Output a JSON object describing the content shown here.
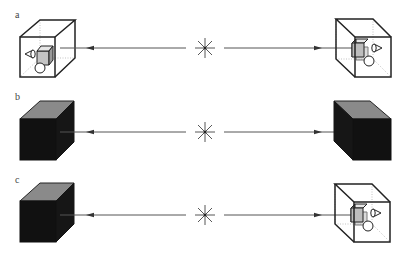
{
  "figure": {
    "colors": {
      "line": "#222222",
      "arrow_line": "#555555",
      "cube_dark": "#161616",
      "cube_top": "#8a8a8a",
      "inner_cube": "#b8b8b8",
      "background": "#ffffff"
    },
    "rows": [
      {
        "label": "a",
        "left_object": "transparent-cube-with-contents",
        "right_object": "transparent-cube-with-contents",
        "connector": "bidirectional-arrow-with-asterisk"
      },
      {
        "label": "b",
        "left_object": "opaque-black-cube",
        "right_object": "opaque-black-cube",
        "connector": "bidirectional-arrow-with-asterisk"
      },
      {
        "label": "c",
        "left_object": "opaque-black-cube",
        "right_object": "transparent-cube-with-contents",
        "connector": "bidirectional-arrow-with-asterisk"
      }
    ],
    "icons": {
      "cone": "cone-icon",
      "sphere": "sphere-icon",
      "inner_cube": "small-cube-icon",
      "asterisk": "asterisk-icon"
    }
  }
}
